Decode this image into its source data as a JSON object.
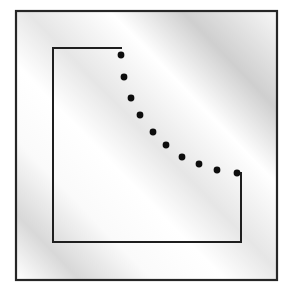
{
  "figure": {
    "canvas": {
      "width": 292,
      "height": 291,
      "background": "#ffffff"
    },
    "frame": {
      "name": "outer-border",
      "x": 16,
      "y": 11,
      "width": 261,
      "height": 269,
      "stroke": "#262626",
      "stroke_width": 2.2,
      "fill": "none"
    },
    "shading": {
      "name": "diagonal-gradient-bands",
      "description": "Soft diagonal gray bands running from lower-left to upper-right",
      "angle_deg": 45,
      "colors": [
        "#ffffff",
        "#d8d8d8",
        "#fafafa",
        "#ffffff",
        "#e6e6e6",
        "#ffffff",
        "#cfcfcf",
        "#f6f6f6"
      ],
      "stops_pct": [
        0,
        12,
        26,
        40,
        52,
        68,
        82,
        100
      ]
    },
    "polyline": {
      "name": "staircase-path",
      "stroke": "#1e1e1e",
      "stroke_width": 2.0,
      "fill": "none",
      "points": [
        {
          "x": 121,
          "y": 48
        },
        {
          "x": 53,
          "y": 48
        },
        {
          "x": 53,
          "y": 242
        },
        {
          "x": 241,
          "y": 242
        },
        {
          "x": 241,
          "y": 173
        }
      ]
    },
    "dots": {
      "name": "dotted-diagonal",
      "color": "#0d0d0d",
      "radius": 3.4,
      "count": 10,
      "points": [
        {
          "x": 121,
          "y": 55
        },
        {
          "x": 124,
          "y": 77
        },
        {
          "x": 131,
          "y": 98
        },
        {
          "x": 140,
          "y": 115
        },
        {
          "x": 153,
          "y": 132
        },
        {
          "x": 166,
          "y": 145
        },
        {
          "x": 182,
          "y": 157
        },
        {
          "x": 199,
          "y": 164
        },
        {
          "x": 217,
          "y": 170
        },
        {
          "x": 237,
          "y": 173
        }
      ]
    }
  }
}
